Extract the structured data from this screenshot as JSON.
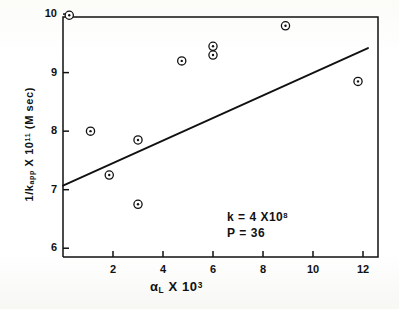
{
  "chart_data": {
    "type": "scatter",
    "title": "",
    "xlabel": "αL X 10³",
    "xlabel_parts": {
      "symbol": "α",
      "subscript": "L",
      "times": "X",
      "base": "10",
      "exponent": "3"
    },
    "ylabel": "1/kapp X 10¹¹ (M sec)",
    "ylabel_parts": {
      "prefix": "1/k",
      "subscript": "app",
      "times": "X",
      "base": "10",
      "exponent": "11",
      "units": "(M sec)"
    },
    "xlim": [
      0,
      12.6
    ],
    "ylim": [
      9.95,
      5.85
    ],
    "y_axis_inverted": true,
    "grid": false,
    "legend": null,
    "xticks": [
      2,
      4,
      6,
      8,
      10,
      12
    ],
    "xtick_labels": [
      "2",
      "4",
      "6",
      "8",
      "10",
      "12"
    ],
    "yticks": [
      10,
      9,
      8,
      7,
      6
    ],
    "ytick_labels": [
      "10",
      "9",
      "8",
      "7",
      "6"
    ],
    "marker_style": "open-circle-with-center-dot",
    "points": [
      {
        "x": 0.25,
        "y": 9.98
      },
      {
        "x": 1.1,
        "y": 8.0
      },
      {
        "x": 1.85,
        "y": 7.25
      },
      {
        "x": 3.0,
        "y": 7.85
      },
      {
        "x": 3.0,
        "y": 6.75
      },
      {
        "x": 4.75,
        "y": 9.2
      },
      {
        "x": 6.0,
        "y": 9.45
      },
      {
        "x": 6.0,
        "y": 9.3
      },
      {
        "x": 8.9,
        "y": 9.8
      },
      {
        "x": 11.8,
        "y": 8.85
      }
    ],
    "fit_line": {
      "type": "linear",
      "x_start": 0.0,
      "y_start": 7.07,
      "x_end": 12.2,
      "y_end": 9.42
    },
    "annotations": [
      {
        "id": "rate-constant",
        "text": "k = 4 X 10⁸",
        "parts": {
          "label": "k",
          "equals": "=",
          "coefficient": "4",
          "times": "X",
          "base": "10",
          "exponent": "8"
        }
      },
      {
        "id": "p-value",
        "text": "P = 36",
        "parts": {
          "label": "P",
          "equals": "=",
          "value": "36"
        }
      }
    ]
  },
  "axis": {
    "x_tick_labels": [
      "2",
      "4",
      "6",
      "8",
      "10",
      "12"
    ],
    "y_tick_labels": [
      "10",
      "9",
      "8",
      "7",
      "6"
    ]
  },
  "annotations": {
    "k_label": "k",
    "k_equals": "=",
    "k_coefficient": "4",
    "k_times": "X",
    "k_base": "10",
    "k_exponent": "8",
    "p_label": "P",
    "p_equals": "=",
    "p_value": "36"
  },
  "labels": {
    "x_symbol": "α",
    "x_subscript": "L",
    "x_times": "X",
    "x_base": "10",
    "x_exponent": "3",
    "y_prefix": "1/k",
    "y_subscript": "app",
    "y_times": "X",
    "y_base": "10",
    "y_exponent": "11",
    "y_units": "(M sec)"
  },
  "colors": {
    "ink": "#111111",
    "paper": "#fdfdfb"
  }
}
